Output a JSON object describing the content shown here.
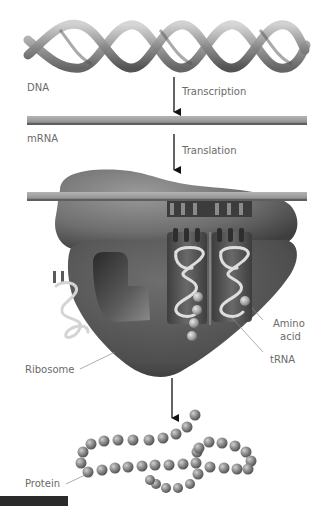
{
  "diagram": {
    "labels": {
      "dna": "DNA",
      "transcription": "Transcription",
      "mrna": "mRNA",
      "translation": "Translation",
      "ribosome": "Ribosome",
      "amino_acid_line1": "Amino",
      "amino_acid_line2": "acid",
      "trna": "tRNA",
      "protein": "Protein"
    },
    "flow": [
      "DNA",
      "Transcription",
      "mRNA",
      "Translation",
      "Ribosome",
      "Protein"
    ],
    "colors": {
      "helix": "#8c8c8c",
      "helix_dark": "#5a5a5a",
      "mrna": "#9a9a9a",
      "mrna_edge": "#5e5e5e",
      "ribosome_large": "#7a7a7a",
      "ribosome_small": "#555555",
      "trna": "#d9d9d9",
      "bead": "#8a8a8a",
      "arrow": "#111111",
      "label": "#6a6a6a"
    }
  }
}
